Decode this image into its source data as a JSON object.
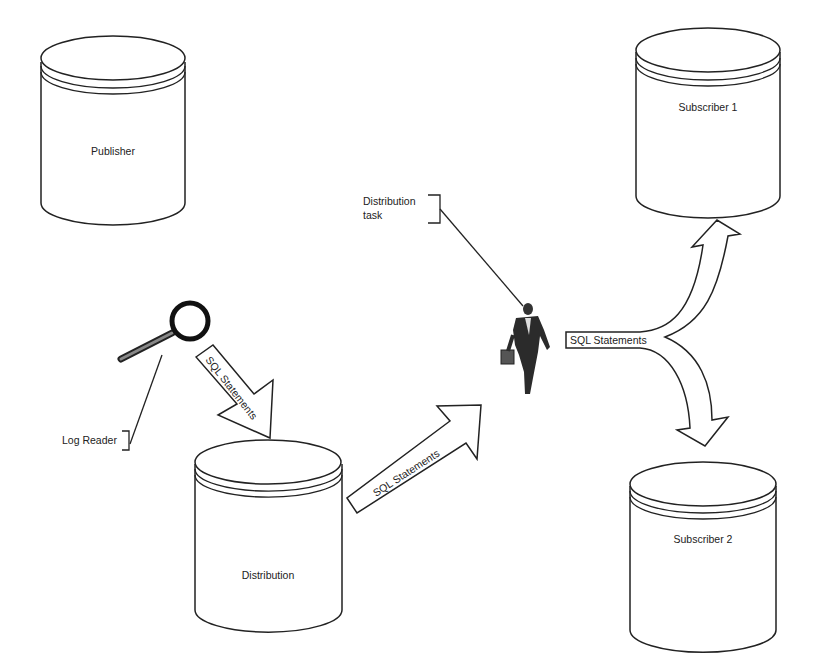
{
  "diagram": {
    "type": "replication-flow",
    "nodes": {
      "publisher": {
        "label": "Publisher",
        "shape": "database-cylinder"
      },
      "distribution": {
        "label": "Distribution",
        "shape": "database-cylinder"
      },
      "subscriber1": {
        "label": "Subscriber 1",
        "shape": "database-cylinder"
      },
      "subscriber2": {
        "label": "Subscriber 2",
        "shape": "database-cylinder"
      }
    },
    "agents": {
      "log_reader": {
        "label": "Log Reader",
        "icon": "magnifying-glass-icon"
      },
      "distribution_task": {
        "label_line1": "Distribution",
        "label_line2": "task",
        "icon": "running-businessman-icon"
      }
    },
    "arrows": {
      "log_to_distribution": {
        "label": "SQL Statements"
      },
      "distribution_to_task": {
        "label": "SQL Statements"
      },
      "task_to_subscribers": {
        "label": "SQL Statements"
      }
    },
    "colors": {
      "stroke": "#222222",
      "background": "#ffffff"
    }
  }
}
